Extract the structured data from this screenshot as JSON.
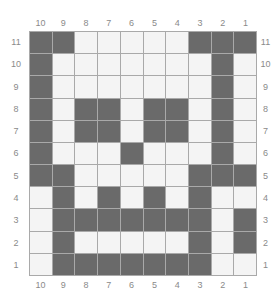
{
  "puzzle": {
    "columns": [
      "10",
      "9",
      "8",
      "7",
      "6",
      "5",
      "4",
      "3",
      "2",
      "1"
    ],
    "rows": [
      "11",
      "10",
      "9",
      "8",
      "7",
      "6",
      "5",
      "4",
      "3",
      "2",
      "1"
    ],
    "colors": {
      "filled": "#6a6a6a",
      "empty": "#f4f4f4",
      "gridline": "#a9a9a9",
      "label": "#8a8a8a"
    },
    "grid": [
      [
        1,
        1,
        0,
        0,
        0,
        0,
        0,
        1,
        1,
        1
      ],
      [
        1,
        0,
        0,
        0,
        0,
        0,
        0,
        0,
        1,
        0
      ],
      [
        1,
        0,
        0,
        0,
        0,
        0,
        0,
        0,
        1,
        0
      ],
      [
        1,
        0,
        1,
        1,
        0,
        1,
        1,
        0,
        1,
        0
      ],
      [
        1,
        0,
        1,
        1,
        0,
        1,
        1,
        0,
        1,
        0
      ],
      [
        1,
        0,
        0,
        0,
        1,
        0,
        0,
        0,
        1,
        0
      ],
      [
        1,
        1,
        0,
        0,
        0,
        0,
        0,
        1,
        1,
        1
      ],
      [
        0,
        1,
        0,
        1,
        0,
        1,
        0,
        1,
        0,
        0
      ],
      [
        0,
        1,
        1,
        1,
        1,
        1,
        1,
        1,
        0,
        1
      ],
      [
        0,
        1,
        0,
        0,
        0,
        0,
        0,
        1,
        0,
        1
      ],
      [
        0,
        1,
        1,
        1,
        1,
        1,
        1,
        1,
        0,
        0
      ]
    ]
  }
}
